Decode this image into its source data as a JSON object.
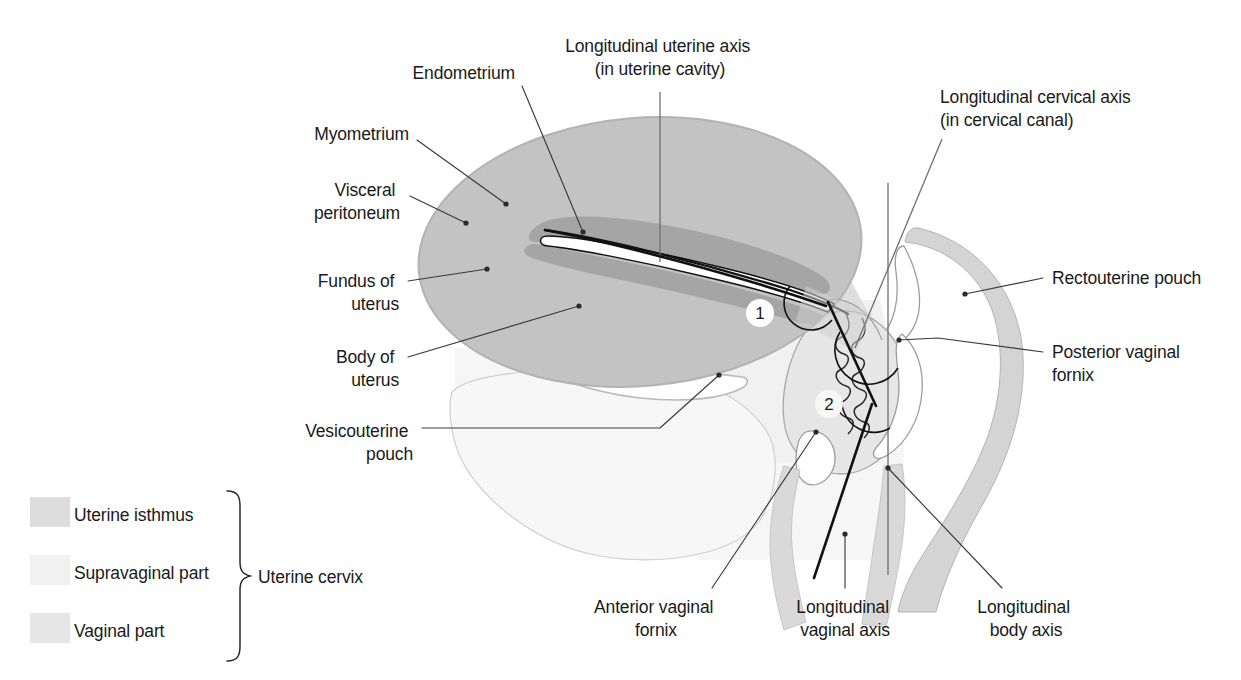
{
  "figure": {
    "background_color": "#ffffff"
  },
  "colors": {
    "myometrium": "#c3c3c3",
    "endometrium": "#a5a5a5",
    "uterine_cavity": "#ffffff",
    "uterine_isthmus": "#dcdcdc",
    "supravaginal_part": "#f1f1f1",
    "vaginal_part": "#e6e6e6",
    "peritoneum_line": "#b9b9b9",
    "organ_outline": "#9a9a9a",
    "bladder_fill": "#f4f4f4",
    "rectum_fill": "#d7d7d7",
    "leader_line": "#3a3a3a",
    "axis_thin": "#6f6f6f",
    "axis_thick": "#111111",
    "text": "#1a1a1a"
  },
  "labels": [
    {
      "id": "endometrium",
      "lines": [
        "Endometrium"
      ],
      "x": 515,
      "y": 79,
      "anchor": "end"
    },
    {
      "id": "longitudinal-uterine-axis",
      "lines": [
        "Longitudinal uterine axis",
        "(in uterine cavity)"
      ],
      "x": 660,
      "y": 52,
      "anchor": "middle"
    },
    {
      "id": "myometrium",
      "lines": [
        "Myometrium"
      ],
      "x": 409,
      "y": 140,
      "anchor": "end"
    },
    {
      "id": "visceral-peritoneum",
      "lines": [
        "Visceral",
        "peritoneum"
      ],
      "x": 400,
      "y": 203,
      "anchor": "end"
    },
    {
      "id": "fundus-of-uterus",
      "lines": [
        "Fundus of",
        "uterus"
      ],
      "x": 399,
      "y": 287,
      "anchor": "end"
    },
    {
      "id": "body-of-uterus",
      "lines": [
        "Body of",
        "uterus"
      ],
      "x": 399,
      "y": 363,
      "anchor": "end"
    },
    {
      "id": "vesicouterine-pouch",
      "lines": [
        "Vesicouterine",
        "pouch"
      ],
      "x": 413,
      "y": 437,
      "anchor": "end"
    },
    {
      "id": "longitudinal-cervical-axis",
      "lines": [
        "Longitudinal cervical axis",
        "(in cervical canal)"
      ],
      "x": 940,
      "y": 103,
      "anchor": "start"
    },
    {
      "id": "rectouterine-pouch",
      "lines": [
        "Rectouterine pouch"
      ],
      "x": 1052,
      "y": 284,
      "anchor": "start"
    },
    {
      "id": "posterior-vaginal-fornix",
      "lines": [
        "Posterior vaginal",
        "fornix"
      ],
      "x": 1052,
      "y": 358,
      "anchor": "start"
    },
    {
      "id": "anterior-vaginal-fornix",
      "lines": [
        "Anterior vaginal",
        "fornix"
      ],
      "x": 656,
      "y": 613,
      "anchor": "middle"
    },
    {
      "id": "longitudinal-vaginal-axis",
      "lines": [
        "Longitudinal",
        "vaginal axis"
      ],
      "x": 845,
      "y": 613,
      "anchor": "middle"
    },
    {
      "id": "longitudinal-body-axis",
      "lines": [
        "Longitudinal",
        "body axis"
      ],
      "x": 1026,
      "y": 613,
      "anchor": "middle"
    }
  ],
  "markers": [
    {
      "id": "marker-1",
      "text": "1",
      "cx": 760,
      "cy": 313,
      "r": 14
    },
    {
      "id": "marker-2",
      "text": "2",
      "cx": 829,
      "cy": 404,
      "r": 14
    }
  ],
  "legend": {
    "bracket_label": "Uterine cervix",
    "bracket_label_x": 258,
    "bracket_label_y": 578,
    "items": [
      {
        "id": "uterine-isthmus",
        "label": "Uterine isthmus",
        "swatch": "#dcdcdc",
        "x": 30,
        "y": 497,
        "text_x": 74,
        "text_y": 521
      },
      {
        "id": "supravaginal-part",
        "label": "Supravaginal part",
        "swatch": "#f1f1f1",
        "x": 30,
        "y": 555,
        "text_x": 74,
        "text_y": 579
      },
      {
        "id": "vaginal-part",
        "label": "Vaginal part",
        "swatch": "#e6e6e6",
        "x": 30,
        "y": 613,
        "text_x": 74,
        "text_y": 637
      }
    ]
  },
  "diagram_notes": {
    "uterine_axis_label_line": "vertical leader from label into uterine cavity",
    "body_axis_line": "vertical gray line through pelvis at x=888",
    "cervical_axis_line": "thin line from upper right label to cervical canal",
    "vaginal_axis_line": "thick black line along vaginal lumen"
  }
}
